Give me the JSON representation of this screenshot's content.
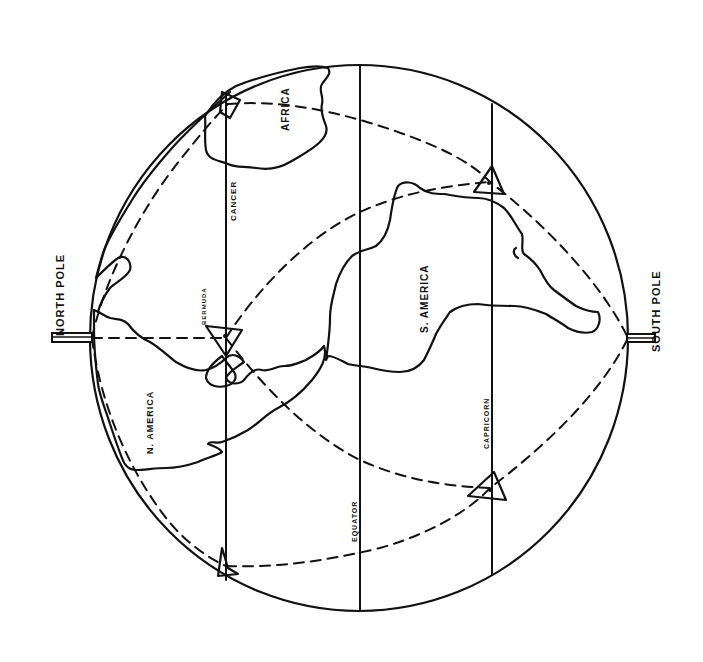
{
  "labels": {
    "north_pole": "NORTH POLE",
    "south_pole": "SOUTH POLE",
    "africa": "AFRICA",
    "cancer": "CANCER",
    "bermuda": "BERMUDA",
    "n_america": "N. AMERICA",
    "s_america": "S. AMERICA",
    "equator": "EQUATOR",
    "capricorn": "CAPRICORN"
  },
  "globe": {
    "cx": 359,
    "cy": 338,
    "rx": 269,
    "ry": 273
  },
  "parallels": [
    {
      "name": "Tropic of Cancer",
      "x": 226
    },
    {
      "name": "Equator",
      "x": 360
    },
    {
      "name": "Tropic of Capricorn",
      "x": 492
    }
  ],
  "markers": [
    {
      "name": "Bermuda triangle",
      "x": 226,
      "y": 338
    },
    {
      "name": "North Africa triangle",
      "x": 228,
      "y": 104
    },
    {
      "name": "South Atlantic triangle north",
      "x": 490,
      "y": 182
    },
    {
      "name": "South Atlantic triangle south",
      "x": 490,
      "y": 488
    },
    {
      "name": "Pacific triangle",
      "x": 226,
      "y": 566
    }
  ],
  "colors": {
    "ink": "#111111",
    "paper": "#ffffff"
  }
}
